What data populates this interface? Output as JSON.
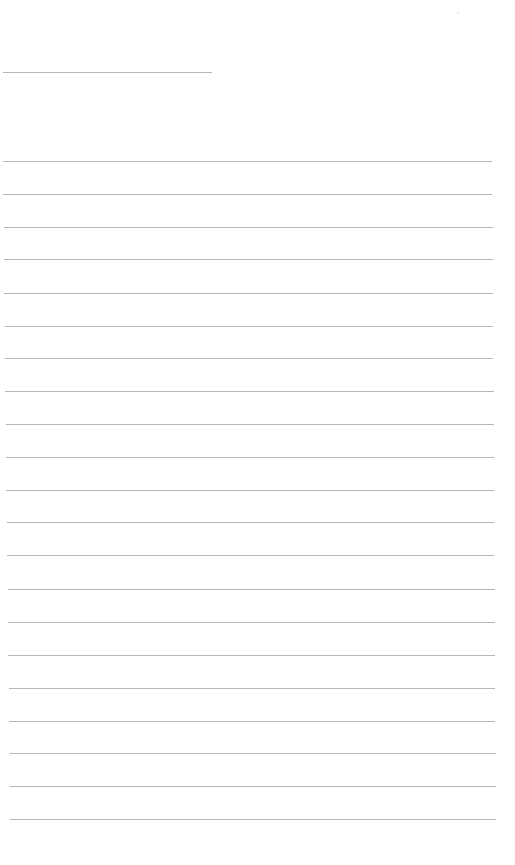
{
  "page": {
    "type": "blank-lined-sheet",
    "background": "#ffffff",
    "rule_color": "#a9a9a9"
  },
  "header_line": {
    "label": "",
    "x1": 3,
    "x2": 212,
    "y": 72
  },
  "ruled_lines": [
    {
      "y": 161,
      "x1": 3,
      "x2": 492,
      "value": ""
    },
    {
      "y": 194,
      "x1": 3,
      "x2": 492,
      "value": ""
    },
    {
      "y": 227,
      "x1": 4,
      "x2": 493,
      "value": ""
    },
    {
      "y": 259,
      "x1": 4,
      "x2": 493,
      "value": ""
    },
    {
      "y": 293,
      "x1": 4,
      "x2": 493,
      "value": ""
    },
    {
      "y": 326,
      "x1": 5,
      "x2": 493,
      "value": ""
    },
    {
      "y": 358,
      "x1": 5,
      "x2": 493,
      "value": ""
    },
    {
      "y": 391,
      "x1": 5,
      "x2": 494,
      "value": ""
    },
    {
      "y": 424,
      "x1": 6,
      "x2": 494,
      "value": ""
    },
    {
      "y": 457,
      "x1": 6,
      "x2": 494,
      "value": ""
    },
    {
      "y": 490,
      "x1": 6,
      "x2": 494,
      "value": ""
    },
    {
      "y": 522,
      "x1": 7,
      "x2": 494,
      "value": ""
    },
    {
      "y": 555,
      "x1": 7,
      "x2": 494,
      "value": ""
    },
    {
      "y": 589,
      "x1": 8,
      "x2": 495,
      "value": ""
    },
    {
      "y": 622,
      "x1": 8,
      "x2": 495,
      "value": ""
    },
    {
      "y": 655,
      "x1": 8,
      "x2": 495,
      "value": ""
    },
    {
      "y": 688,
      "x1": 9,
      "x2": 495,
      "value": ""
    },
    {
      "y": 721,
      "x1": 9,
      "x2": 495,
      "value": ""
    },
    {
      "y": 753,
      "x1": 10,
      "x2": 496,
      "value": ""
    },
    {
      "y": 786,
      "x1": 10,
      "x2": 496,
      "value": ""
    },
    {
      "y": 819,
      "x1": 10,
      "x2": 496,
      "value": ""
    }
  ]
}
